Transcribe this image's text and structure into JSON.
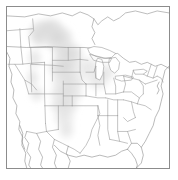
{
  "figure": {
    "kind": "map",
    "title": "",
    "region": "United States",
    "projection_note": "conic",
    "background_color": "#ffffff",
    "frame": {
      "visible": true,
      "color": "#8c8c8c",
      "x": 6,
      "y": 6,
      "width": 164,
      "height": 163
    }
  },
  "layers": {
    "state_boundaries": {
      "label": "state-boundaries",
      "stroke_color": "#9a9a9a",
      "stroke_width": 0.6
    },
    "country_boundaries": {
      "label": "country-boundaries",
      "stroke_color": "#8f8f8f",
      "stroke_width": 0.6
    },
    "coastline": {
      "label": "coastline",
      "stroke_color": "#8a8a8a",
      "stroke_width": 0.6
    },
    "lakes": {
      "label": "great-lakes",
      "stroke_color": "#9a9a9a",
      "fill_color": "#ffffff"
    },
    "shaded_overlay": {
      "label": "shaded-plains-band",
      "fill_color": "#d9d9d9",
      "opacity": 0.55,
      "description": "diffuse grey band over the northern Rockies, Great Plains and southern plains"
    }
  },
  "chart_data": {
    "type": "map",
    "title": "",
    "xlabel": "",
    "ylabel": "",
    "legend": [],
    "annotations": [],
    "shaded_regions": [
      {
        "name": "northern-plains-shading",
        "intensity": 0.55
      },
      {
        "name": "central-plains-shading",
        "intensity": 0.5
      },
      {
        "name": "southern-plains-shading",
        "intensity": 0.4
      }
    ]
  }
}
